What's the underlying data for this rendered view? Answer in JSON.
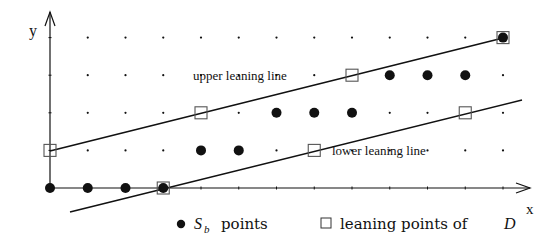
{
  "axes": {
    "x_label": "x",
    "y_label": "y",
    "origin_px": [
      50,
      188
    ],
    "col_spacing_px": 37.75,
    "row_spacing_px": 37.6,
    "x_end_px": 530,
    "y_end_px": 12
  },
  "grid": {
    "cols": 13,
    "rows": 5
  },
  "filled_points": [
    [
      0,
      0
    ],
    [
      1,
      0
    ],
    [
      2,
      0
    ],
    [
      3,
      0
    ],
    [
      4,
      1
    ],
    [
      5,
      1
    ],
    [
      6,
      2
    ],
    [
      7,
      2
    ],
    [
      8,
      2
    ],
    [
      9,
      3
    ],
    [
      10,
      3
    ],
    [
      11,
      3
    ],
    [
      12,
      4
    ]
  ],
  "leaning_points": [
    [
      0,
      1
    ],
    [
      3,
      0
    ],
    [
      4,
      2
    ],
    [
      7,
      1
    ],
    [
      8,
      3
    ],
    [
      11,
      2
    ],
    [
      12,
      4
    ]
  ],
  "lines": {
    "upper": {
      "label": "upper leaning line",
      "from": [
        50,
        151
      ],
      "to": [
        503,
        38
      ]
    },
    "lower": {
      "label": "lower leaning line",
      "from": [
        70,
        212
      ],
      "to": [
        522,
        100
      ]
    }
  },
  "legend": {
    "sb_symbol": "S",
    "sb_subscript": "b",
    "sb_text": "points",
    "leaning_text": "leaning points of",
    "leaning_var": "D"
  },
  "colors": {
    "ink": "#111111",
    "square_stroke": "#555555"
  }
}
